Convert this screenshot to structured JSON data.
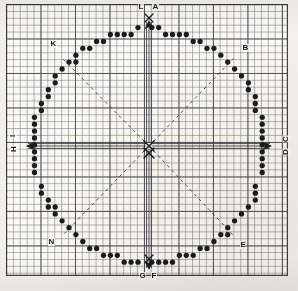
{
  "sheet": {
    "kind": "graph-paper-chart",
    "title_visible": false,
    "paper_color": "#faf8f4",
    "grid_minor_color": "#787880",
    "grid_major_color": "#46464b",
    "ink_color": "#1c1c1e",
    "minor_cell_px": 6.9,
    "major_every_cells": 5
  },
  "labels": {
    "top_left": "L",
    "top_right": "A",
    "upper_left": "K",
    "upper_right": "B",
    "left_upper": "I",
    "left_lower": "H",
    "right_upper": "C",
    "right_lower": "D",
    "lower_left": "N",
    "lower_right": "E",
    "bottom_left": "G",
    "bottom_right": "F"
  },
  "center": {
    "mark": "X",
    "mark_secondary": "X"
  },
  "chart_data": {
    "type": "scatter",
    "title": "",
    "subtitle": "",
    "xlabel": "",
    "ylabel": "",
    "grid": true,
    "legend": "none",
    "xlim": [
      0,
      40
    ],
    "ylim": [
      0,
      39
    ],
    "stations": [
      {
        "label": "A",
        "position": "top-right-of-center",
        "x": 21,
        "y": 1
      },
      {
        "label": "B",
        "position": "upper-right",
        "x": 34,
        "y": 6
      },
      {
        "label": "C",
        "position": "right-upper",
        "x": 39,
        "y": 18
      },
      {
        "label": "D",
        "position": "right-lower",
        "x": 39,
        "y": 21
      },
      {
        "label": "E",
        "position": "lower-right",
        "x": 34,
        "y": 33
      },
      {
        "label": "F",
        "position": "bottom-right-of-center",
        "x": 21,
        "y": 38
      },
      {
        "label": "G",
        "position": "bottom-left-of-center",
        "x": 19,
        "y": 38
      },
      {
        "label": "H",
        "position": "left-lower",
        "x": 1,
        "y": 21
      },
      {
        "label": "I",
        "position": "left-upper",
        "x": 1,
        "y": 18
      },
      {
        "label": "K",
        "position": "upper-left",
        "x": 6,
        "y": 6
      },
      {
        "label": "L",
        "position": "top-left-of-center",
        "x": 19,
        "y": 1
      },
      {
        "label": "N",
        "position": "lower-left",
        "x": 6,
        "y": 33
      }
    ],
    "series": [
      {
        "name": "rim-dots",
        "marker": "filled-circle",
        "marker_color": "#1c1c1e",
        "count": 96,
        "description": "Ring of filled circular dots tracing a circle of radius ~17 cells about the centre."
      }
    ],
    "guides": [
      {
        "name": "diagonal-ne",
        "style": "dashed",
        "from": "center",
        "to": "upper-right"
      },
      {
        "name": "diagonal-nw",
        "style": "dashed",
        "from": "center",
        "to": "upper-left"
      },
      {
        "name": "diagonal-se",
        "style": "dashed",
        "from": "center",
        "to": "lower-right"
      },
      {
        "name": "diagonal-sw",
        "style": "dashed",
        "from": "center",
        "to": "lower-left"
      },
      {
        "name": "axis-up",
        "style": "double-rule-arrow",
        "from": "center",
        "to": "top"
      },
      {
        "name": "axis-down",
        "style": "double-rule-arrow",
        "from": "center",
        "to": "bottom"
      },
      {
        "name": "axis-left",
        "style": "double-rule-arrow",
        "from": "center",
        "to": "left"
      },
      {
        "name": "axis-right",
        "style": "double-rule-arrow",
        "from": "center",
        "to": "right"
      }
    ]
  }
}
